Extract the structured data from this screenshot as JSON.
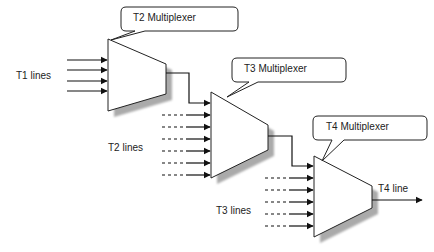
{
  "diagram": {
    "colors": {
      "line": "#222222",
      "shadow": "#b0b0b0",
      "background": "#ffffff"
    },
    "multiplexers": [
      {
        "id": "mux1",
        "label": "T2 Multiplexer",
        "input_label": "T1 lines",
        "input_count": 4
      },
      {
        "id": "mux2",
        "label": "T3 Multiplexer",
        "input_label": "T2 lines",
        "input_count": 7
      },
      {
        "id": "mux3",
        "label": "T4 Multiplexer",
        "input_label": "T3 lines",
        "input_count": 6
      }
    ],
    "output_label": "T4 line"
  }
}
